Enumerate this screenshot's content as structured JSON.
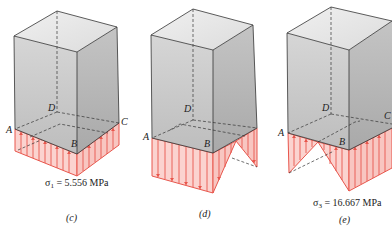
{
  "figures": [
    {
      "id": "c",
      "caption": "(c)",
      "stress_symbol": "σ",
      "stress_subscript": "1",
      "stress_value": " = 5.556 MPa",
      "distribution": "uniform",
      "direction": "up",
      "corner_labels": {
        "A": "A",
        "B": "B",
        "C": "C",
        "D": "D"
      }
    },
    {
      "id": "d",
      "caption": "(d)",
      "distribution": "linear-varying (down on face AB, triangular on face BC)",
      "direction": "down",
      "corner_labels": {
        "A": "A",
        "B": "B",
        "D": "D"
      }
    },
    {
      "id": "e",
      "caption": "(e)",
      "stress_symbol": "σ",
      "stress_subscript": "3",
      "stress_value": " = 16.667 MPa",
      "distribution": "linear-varying (triangular on face AB, up on face BC)",
      "direction": "up",
      "corner_labels": {
        "A": "A",
        "B": "B",
        "C": "C",
        "D": "D"
      }
    }
  ],
  "colors": {
    "stress_fill": "#fbd3cf",
    "stress_line": "#e8564c",
    "box_front": "#c9c9c9",
    "box_right": "#b9b9b9",
    "box_top": "#e6e6e6",
    "edge": "#333333"
  }
}
